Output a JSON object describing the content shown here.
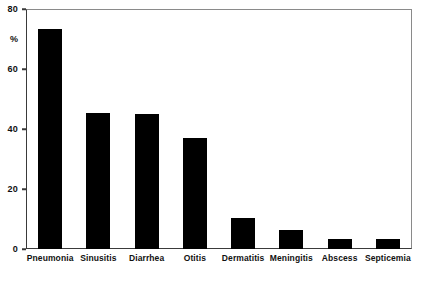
{
  "chart_data": {
    "type": "bar",
    "title": "",
    "subtitle": "",
    "xlabel": "",
    "ylabel": "%",
    "categories": [
      "Pneumonia",
      "Sinusitis",
      "Diarrhea",
      "Otitis",
      "Dermatitis",
      "Meningitis",
      "Abscess",
      "Septicemia"
    ],
    "values": [
      73.5,
      45.5,
      45,
      37,
      10.5,
      6.5,
      3.5,
      3.5
    ],
    "ylim": [
      0,
      80
    ],
    "yticks": [
      0,
      20,
      40,
      60,
      80
    ],
    "ytick_labels": [
      "0",
      "20",
      "40",
      "60",
      "80"
    ],
    "grid": false,
    "legend": null,
    "bar_color": "#000000",
    "axis_color": "#3a3a3a",
    "frame_color": "#8a8a8a",
    "background": "#ffffff",
    "annotations": []
  },
  "axis": {
    "unit_label": "%",
    "unit_label_value": 70
  }
}
